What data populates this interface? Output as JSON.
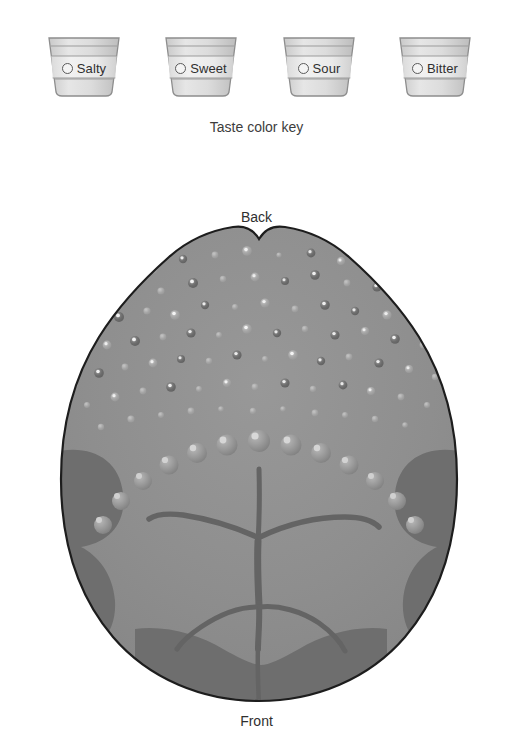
{
  "legend": {
    "caption": "Taste color key",
    "cups": [
      {
        "label": "Salty",
        "icon": "radio-button-icon",
        "color": "#d9d9d9"
      },
      {
        "label": "Sweet",
        "icon": "radio-button-icon",
        "color": "#d9d9d9"
      },
      {
        "label": "Sour",
        "icon": "radio-button-icon",
        "color": "#d9d9d9"
      },
      {
        "label": "Bitter",
        "icon": "radio-button-icon",
        "color": "#d9d9d9"
      }
    ]
  },
  "diagram": {
    "title_back": "Back",
    "title_front": "Front",
    "colors": {
      "tongue_body": "#8e8e8e",
      "tongue_body_light": "#949494",
      "lateral_patch": "#6e6e6e",
      "tip_patch": "#6e6e6e",
      "sulcus": "#646464",
      "outline": "#1d1d1d",
      "papilla_dark": "#6f6f6f",
      "papilla_light": "#a8a8a8",
      "papilla_highlight": "#e8e8e8"
    },
    "features": {
      "small_papillae_label": "fungiform-papillae",
      "large_papillae_label": "circumvallate-papillae",
      "sulcus_label": "median-sulcus",
      "lateral_label": "lateral-taste-region",
      "tip_label": "tip-taste-region"
    }
  }
}
